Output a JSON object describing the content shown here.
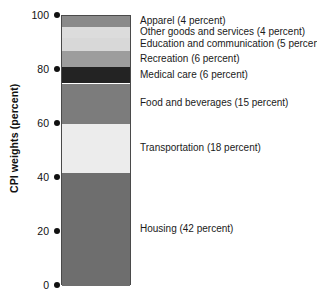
{
  "chart_data": {
    "type": "bar",
    "subtype": "stacked-bar-single-column",
    "title": "",
    "xlabel": "",
    "ylabel": "CPI weights (percent)",
    "ylim": [
      0,
      100
    ],
    "yticks": [
      0,
      20,
      40,
      60,
      80,
      100
    ],
    "ytick_labels": [
      "0",
      "20",
      "40",
      "60",
      "80",
      "100"
    ],
    "grid": false,
    "legend": "inline-right-of-bar",
    "categories": [
      "Housing",
      "Transportation",
      "Food and beverages",
      "Medical care",
      "Recreation",
      "Education and communication",
      "Other goods and services",
      "Apparel"
    ],
    "values": [
      42,
      18,
      15,
      6,
      6,
      5,
      4,
      4
    ],
    "segments": [
      {
        "name": "Housing",
        "label": "Housing (42 percent)",
        "value": 42,
        "unit": "percent",
        "bottom": 0,
        "top": 42,
        "color": "#6e6e6e"
      },
      {
        "name": "Transportation",
        "label": "Transportation (18 percent)",
        "value": 18,
        "unit": "percent",
        "bottom": 42,
        "top": 60,
        "color": "#ececec"
      },
      {
        "name": "Food and beverages",
        "label": "Food and beverages (15 percent)",
        "value": 15,
        "unit": "percent",
        "bottom": 60,
        "top": 75,
        "color": "#7c7c7c"
      },
      {
        "name": "Medical care",
        "label": "Medical care (6 percent)",
        "value": 6,
        "unit": "percent",
        "bottom": 75,
        "top": 81,
        "color": "#232323"
      },
      {
        "name": "Recreation",
        "label": "Recreation (6 percent)",
        "value": 6,
        "unit": "percent",
        "bottom": 81,
        "top": 87,
        "color": "#9d9d9d"
      },
      {
        "name": "Education and communication",
        "label": "Education and communication (5 percent)",
        "value": 5,
        "unit": "percent",
        "bottom": 87,
        "top": 92,
        "color": "#d8d8d8"
      },
      {
        "name": "Other goods and services",
        "label": "Other goods and services (4 percent)",
        "value": 4,
        "unit": "percent",
        "bottom": 92,
        "top": 96,
        "color": "#dcdcdc"
      },
      {
        "name": "Apparel",
        "label": "Apparel (4 percent)",
        "value": 4,
        "unit": "percent",
        "bottom": 96,
        "top": 100,
        "color": "#8a8a8a"
      }
    ],
    "label_rows": [
      {
        "label": "Apparel (4 percent)",
        "at": 98
      },
      {
        "label": "Other goods and services (4 percent)",
        "at": 94
      },
      {
        "label": "Education and communication (5 percent)",
        "at": 89.5
      },
      {
        "label": "Recreation (6 percent)",
        "at": 84
      },
      {
        "label": "Medical care (6 percent)",
        "at": 78
      },
      {
        "label": "Food and beverages (15 percent)",
        "at": 67.5
      },
      {
        "label": "Transportation (18 percent)",
        "at": 51
      },
      {
        "label": "Housing (42 percent)",
        "at": 21
      }
    ],
    "colors": {
      "background": "#ffffff",
      "text": "#1a1a1a",
      "axis": "#111111",
      "bar_border": "#4a4a4a"
    }
  }
}
